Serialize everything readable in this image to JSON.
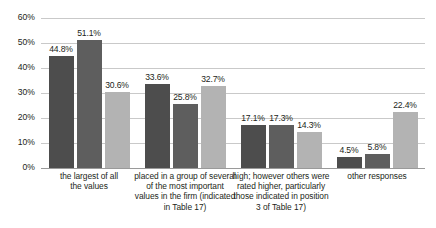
{
  "chart_data": {
    "type": "bar",
    "title": "",
    "subtitle": "",
    "xlabel": "",
    "ylabel": "",
    "ylim": [
      0,
      60
    ],
    "ytick_labels": [
      "0%",
      "10%",
      "20%",
      "30%",
      "40%",
      "50%",
      "60%"
    ],
    "ytick_values": [
      0,
      10,
      20,
      30,
      40,
      50,
      60
    ],
    "grid": true,
    "legend": "none",
    "categories": [
      "the largest of all the values",
      "placed in a group of several of the most important values in the firm (indicated in Table 17)",
      "high; however others were rated higher, particularly those indicated in position 3 of Table 17)",
      "other responses"
    ],
    "category_lines": [
      [
        "the largest of all",
        "the values"
      ],
      [
        "placed in a group of several",
        "of the most important",
        "values in the firm (indicated",
        "in Table 17)"
      ],
      [
        "high; however others were",
        "rated higher, particularly",
        "those indicated in position",
        "3 of Table 17)"
      ],
      [
        "other responses"
      ]
    ],
    "series": [
      {
        "name": "series-1",
        "color": "#4d4d4d",
        "values": [
          44.8,
          33.6,
          17.1,
          4.5
        ],
        "labels": [
          "44.8%",
          "33.6%",
          "17.1%",
          "4.5%"
        ]
      },
      {
        "name": "series-2",
        "color": "#5e5e5e",
        "values": [
          51.1,
          25.8,
          17.3,
          5.8
        ],
        "labels": [
          "51.1%",
          "25.8%",
          "17.3%",
          "5.8%"
        ]
      },
      {
        "name": "series-3",
        "color": "#b3b3b3",
        "values": [
          30.6,
          32.7,
          14.3,
          22.4
        ],
        "labels": [
          "30.6%",
          "32.7%",
          "14.3%",
          "22.4%"
        ]
      }
    ]
  },
  "colors": {
    "series_1": "#4d4d4d",
    "series_2": "#5e5e5e",
    "series_3": "#b3b3b3",
    "gridline": "#c9c9c9",
    "axis": "#9a9a9a",
    "text": "#231f20",
    "background": "#ffffff"
  }
}
